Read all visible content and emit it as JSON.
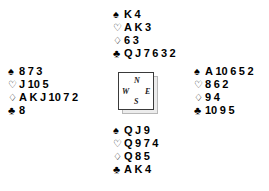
{
  "diagram": {
    "type": "bridge-deal",
    "suit_symbols": {
      "spades": "♠",
      "hearts": "♡",
      "diamonds": "♢",
      "clubs": "♣"
    },
    "compass": {
      "north": "N",
      "west": "W",
      "east": "E",
      "south": "S"
    },
    "hands": {
      "north": {
        "position_label": "North",
        "spades": "K 4",
        "hearts": "A K 3",
        "diamonds": "6 3",
        "clubs": "Q J 7 6 3 2"
      },
      "west": {
        "position_label": "West",
        "spades": "8 7 3",
        "hearts": "J 10 5",
        "diamonds": "A K J 10 7 2",
        "clubs": "8"
      },
      "east": {
        "position_label": "East",
        "spades": "A 10 6 5 2",
        "hearts": "8 6 2",
        "diamonds": "9 4",
        "clubs": "10 9 5"
      },
      "south": {
        "position_label": "South",
        "spades": "Q J 9",
        "hearts": "Q 9 7 4",
        "diamonds": "Q 8 5",
        "clubs": "A K 4"
      }
    }
  }
}
